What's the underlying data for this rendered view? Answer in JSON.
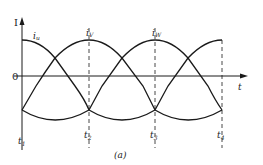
{
  "figure": {
    "caption": "(a)",
    "y_axis_label": "I",
    "x_axis_label": "t",
    "zero_label": "0",
    "curve_labels": [
      "iᵤ",
      "iᵥ",
      "iᵥw"
    ],
    "curve_label_text": {
      "u": "i",
      "u_sub": "u",
      "v": "i",
      "v_sub": "V",
      "w": "i",
      "w_sub": "W"
    },
    "time_labels": [
      {
        "main": "t",
        "sub": "1"
      },
      {
        "main": "t",
        "sub": "2"
      },
      {
        "main": "t",
        "sub": "3"
      },
      {
        "main": "t",
        "sub": "4"
      }
    ]
  },
  "colors": {
    "line": "#1a1a1a",
    "background": "#ffffff"
  }
}
